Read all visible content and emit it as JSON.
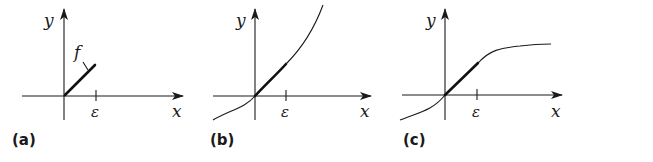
{
  "figure": {
    "panels": [
      {
        "id": "a",
        "label": "(a)",
        "x_label": "x",
        "y_label": "y",
        "tick_label": "ε",
        "function_label": "f"
      },
      {
        "id": "b",
        "label": "(b)",
        "x_label": "x",
        "y_label": "y",
        "tick_label": "ε"
      },
      {
        "id": "c",
        "label": "(c)",
        "x_label": "x",
        "y_label": "y",
        "tick_label": "ε"
      }
    ],
    "colors": {
      "ink": "#1a1a1a",
      "background": "#ffffff"
    }
  }
}
